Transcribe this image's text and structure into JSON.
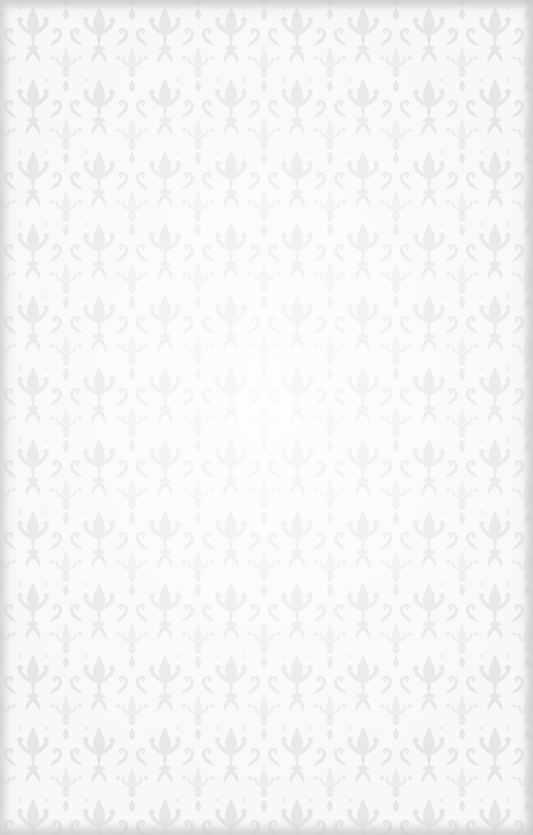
{
  "background": {
    "description": "Light gray damask pattern texture",
    "base_color": "#f8f8f8",
    "motif_color": "#e4e4e4",
    "edge_shade_color": "#cfcfcf",
    "pattern_icon": "damask-motif-icon"
  }
}
